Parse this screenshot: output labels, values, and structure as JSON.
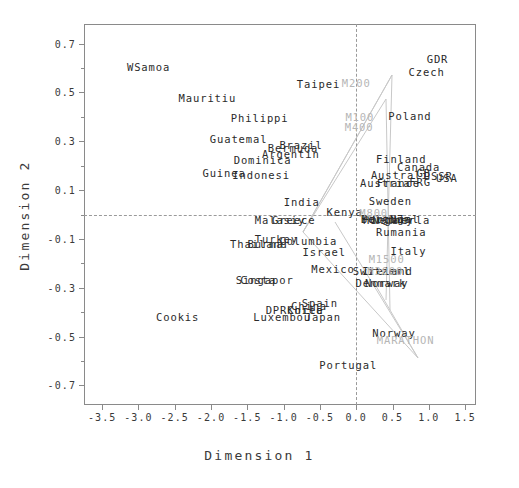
{
  "chart_data": {
    "type": "scatter",
    "title": "",
    "xlabel": "Dimension 1",
    "ylabel": "Dimension 2",
    "xlim": [
      -3.75,
      1.65
    ],
    "ylim": [
      -0.78,
      0.78
    ],
    "xticks": [
      "-3.5",
      "-3.0",
      "-2.5",
      "-2.0",
      "-1.5",
      "-1.0",
      "-0.5",
      "0.0",
      "0.5",
      "1.0",
      "1.5"
    ],
    "xtickvals": [
      -3.5,
      -3.0,
      -2.5,
      -2.0,
      -1.5,
      -1.0,
      -0.5,
      0.0,
      0.5,
      1.0,
      1.5
    ],
    "yticks": [
      "0.7",
      "0.5",
      "0.3",
      "0.1",
      "-0.1",
      "-0.3",
      "-0.5",
      "-0.7"
    ],
    "ytickvals": [
      0.7,
      0.5,
      0.3,
      0.1,
      -0.1,
      -0.3,
      -0.5,
      -0.7
    ],
    "yminorvals": [
      0.6,
      0.4,
      0.2,
      0.0,
      -0.2,
      -0.4,
      -0.6
    ],
    "grid": false,
    "legend": "none",
    "reference_lines": {
      "vertical_x": 0.0,
      "horizontal_y": 0.0,
      "style": "dashed"
    },
    "series": [
      {
        "name": "countries",
        "color": "#2b2b2b",
        "points": [
          {
            "label": "WSamoa",
            "x": -2.86,
            "y": 0.605
          },
          {
            "label": "Mauritiu",
            "x": -2.05,
            "y": 0.475
          },
          {
            "label": "Philippi",
            "x": -1.33,
            "y": 0.395
          },
          {
            "label": "Taipei",
            "x": -0.52,
            "y": 0.535
          },
          {
            "label": "GDR",
            "x": 1.12,
            "y": 0.635
          },
          {
            "label": "Czech",
            "x": 0.97,
            "y": 0.585
          },
          {
            "label": "Guatemal",
            "x": -1.62,
            "y": 0.31
          },
          {
            "label": "Poland",
            "x": 0.74,
            "y": 0.405
          },
          {
            "label": "Bermuda",
            "x": -0.87,
            "y": 0.272
          },
          {
            "label": "Brazil",
            "x": -0.76,
            "y": 0.283
          },
          {
            "label": "Argentin",
            "x": -0.9,
            "y": 0.248
          },
          {
            "label": "Dominica",
            "x": -1.29,
            "y": 0.222
          },
          {
            "label": "Finland",
            "x": 0.62,
            "y": 0.228
          },
          {
            "label": "Canada",
            "x": 0.86,
            "y": 0.196
          },
          {
            "label": "Guinea",
            "x": -1.82,
            "y": 0.168
          },
          {
            "label": "Indonesi",
            "x": -1.31,
            "y": 0.16
          },
          {
            "label": "Australi",
            "x": 0.6,
            "y": 0.162
          },
          {
            "label": "GB",
            "x": 0.93,
            "y": 0.168
          },
          {
            "label": "USSR",
            "x": 1.13,
            "y": 0.158
          },
          {
            "label": "USA",
            "x": 1.25,
            "y": 0.15
          },
          {
            "label": "Austria",
            "x": 0.4,
            "y": 0.128
          },
          {
            "label": "France",
            "x": 0.58,
            "y": 0.128
          },
          {
            "label": "FRG",
            "x": 0.88,
            "y": 0.132
          },
          {
            "label": "India",
            "x": -0.75,
            "y": 0.052
          },
          {
            "label": "Sweden",
            "x": 0.47,
            "y": 0.055
          },
          {
            "label": "Kenya",
            "x": -0.16,
            "y": 0.012
          },
          {
            "label": "Malasiy",
            "x": -1.05,
            "y": -0.022
          },
          {
            "label": "Greece",
            "x": -0.86,
            "y": -0.022
          },
          {
            "label": "Belgium",
            "x": 0.41,
            "y": -0.02
          },
          {
            "label": "Portugal2",
            "x": 0.47,
            "y": -0.02
          },
          {
            "label": "NZ",
            "x": 0.56,
            "y": -0.02
          },
          {
            "label": "Hungary",
            "x": 0.44,
            "y": -0.022
          },
          {
            "label": "Netherla",
            "x": 0.62,
            "y": -0.022
          },
          {
            "label": "Rumania",
            "x": 0.62,
            "y": -0.07
          },
          {
            "label": "Turkey",
            "x": -1.1,
            "y": -0.102
          },
          {
            "label": "Columbia",
            "x": -0.66,
            "y": -0.108
          },
          {
            "label": "Thailand",
            "x": -1.34,
            "y": -0.122
          },
          {
            "label": "Burma",
            "x": -1.25,
            "y": -0.122
          },
          {
            "label": "Israel",
            "x": -0.44,
            "y": -0.152
          },
          {
            "label": "Italy",
            "x": 0.72,
            "y": -0.15
          },
          {
            "label": "Mexico",
            "x": -0.32,
            "y": -0.225
          },
          {
            "label": "Switzerl",
            "x": 0.35,
            "y": -0.232
          },
          {
            "label": "Ireland",
            "x": 0.43,
            "y": -0.232
          },
          {
            "label": "Costa",
            "x": -1.35,
            "y": -0.268
          },
          {
            "label": "Singapor",
            "x": -1.26,
            "y": -0.268
          },
          {
            "label": "Denmark",
            "x": 0.34,
            "y": -0.282
          },
          {
            "label": "Norway2",
            "x": 0.42,
            "y": -0.282
          },
          {
            "label": "China",
            "x": -0.65,
            "y": -0.375
          },
          {
            "label": "Spain",
            "x": -0.5,
            "y": -0.362
          },
          {
            "label": "DPRKorea",
            "x": -0.85,
            "y": -0.392
          },
          {
            "label": "Chile",
            "x": -0.7,
            "y": -0.392
          },
          {
            "label": "Cookis",
            "x": -2.46,
            "y": -0.418
          },
          {
            "label": "Luxembou",
            "x": -1.02,
            "y": -0.42
          },
          {
            "label": "Japan",
            "x": -0.46,
            "y": -0.42
          },
          {
            "label": "Norway",
            "x": 0.52,
            "y": -0.485
          },
          {
            "label": "Portugal",
            "x": -0.11,
            "y": -0.615
          }
        ]
      },
      {
        "name": "events",
        "color": "#b6b6b6",
        "points": [
          {
            "label": "M200",
            "x": 0.0,
            "y": 0.538
          },
          {
            "label": "M100",
            "x": 0.05,
            "y": 0.398
          },
          {
            "label": "M400",
            "x": 0.04,
            "y": 0.358
          },
          {
            "label": "M800",
            "x": 0.24,
            "y": 0.008
          },
          {
            "label": "M1500",
            "x": 0.42,
            "y": -0.182
          },
          {
            "label": "M3000",
            "x": 0.4,
            "y": -0.232
          },
          {
            "label": "MARATHON",
            "x": 0.68,
            "y": -0.512
          }
        ]
      }
    ],
    "vectors": {
      "origin_note": "rays fanning from lower-left toward the event labels",
      "color": "#c6c6c6"
    }
  }
}
